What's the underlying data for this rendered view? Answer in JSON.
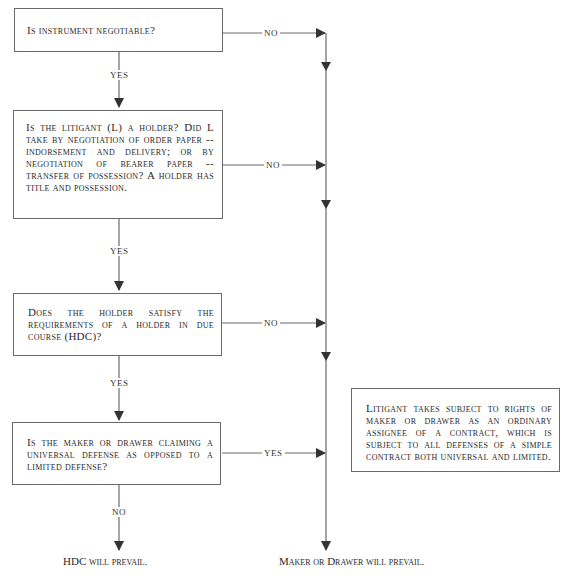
{
  "diagram": {
    "type": "flowchart",
    "boxes": [
      {
        "id": "q1",
        "text": "Is instrument negotiable?"
      },
      {
        "id": "q2",
        "text": "Is the litigant (L) a holder? Did L take by negotiation of order paper -- indorsement and delivery; or by negotiation of bearer paper -- transfer of possession? A holder has title and possession."
      },
      {
        "id": "q3",
        "text": "Does the holder satisfy the requirements of a holder in due course (HDC)?"
      },
      {
        "id": "q4",
        "text": "Is the maker or drawer claiming a universal defense as opposed to a limited defense?"
      },
      {
        "id": "r1",
        "text": "Litigant takes subject to rights of maker or drawer as an ordinary assignee of a contract, which is subject to all defenses of a simple contract both universal and limited."
      }
    ],
    "edge_labels": {
      "q1_no": "NO",
      "q1_yes": "YES",
      "q2_no": "NO",
      "q2_yes": "YES",
      "q3_no": "NO",
      "q3_yes": "YES",
      "q4_yes": "YES",
      "q4_no": "NO"
    },
    "outcomes": {
      "hdc": "HDC will prevail.",
      "maker": "Maker or Drawer will prevail."
    },
    "colors": {
      "line": "#6a6a6a",
      "arrow": "#333333",
      "text": "#2a2a2a"
    }
  }
}
